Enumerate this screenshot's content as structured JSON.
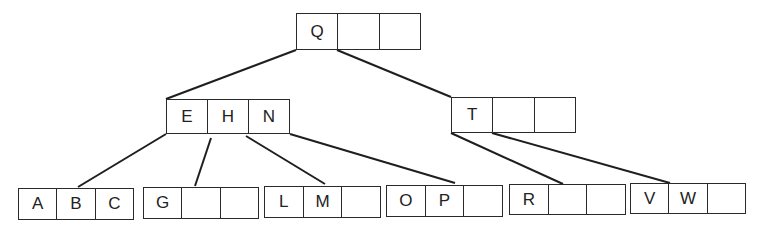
{
  "diagram": {
    "type": "b-tree",
    "nodes": [
      {
        "id": "root",
        "keys": [
          "Q",
          "",
          ""
        ],
        "x": 296,
        "y": 13,
        "w": 125,
        "h": 37
      },
      {
        "id": "ehn",
        "keys": [
          "E",
          "H",
          "N"
        ],
        "x": 166,
        "y": 99,
        "w": 124,
        "h": 35
      },
      {
        "id": "t",
        "keys": [
          "T",
          "",
          ""
        ],
        "x": 451,
        "y": 97,
        "w": 125,
        "h": 36
      },
      {
        "id": "abc",
        "keys": [
          "A",
          "B",
          "C"
        ],
        "x": 18,
        "y": 188,
        "w": 116,
        "h": 32
      },
      {
        "id": "g",
        "keys": [
          "G",
          "",
          ""
        ],
        "x": 143,
        "y": 187,
        "w": 116,
        "h": 32
      },
      {
        "id": "lm",
        "keys": [
          "L",
          "M",
          ""
        ],
        "x": 264,
        "y": 186,
        "w": 117,
        "h": 32
      },
      {
        "id": "op",
        "keys": [
          "O",
          "P",
          ""
        ],
        "x": 386,
        "y": 185,
        "w": 117,
        "h": 32
      },
      {
        "id": "r",
        "keys": [
          "R",
          "",
          ""
        ],
        "x": 509,
        "y": 184,
        "w": 117,
        "h": 31
      },
      {
        "id": "vw",
        "keys": [
          "V",
          "W",
          ""
        ],
        "x": 630,
        "y": 183,
        "w": 116,
        "h": 31
      }
    ],
    "edges": [
      {
        "from": "root",
        "to": "ehn",
        "x1": 296,
        "y1": 50,
        "x2": 166,
        "y2": 99
      },
      {
        "from": "root",
        "to": "t",
        "x1": 337,
        "y1": 50,
        "x2": 451,
        "y2": 97
      },
      {
        "from": "ehn",
        "to": "abc",
        "x1": 166,
        "y1": 134,
        "x2": 78,
        "y2": 187
      },
      {
        "from": "ehn",
        "to": "g",
        "x1": 211,
        "y1": 138,
        "x2": 195,
        "y2": 186
      },
      {
        "from": "ehn",
        "to": "lm",
        "x1": 246,
        "y1": 136,
        "x2": 325,
        "y2": 184
      },
      {
        "from": "ehn",
        "to": "op",
        "x1": 290,
        "y1": 134,
        "x2": 455,
        "y2": 183
      },
      {
        "from": "t",
        "to": "r",
        "x1": 451,
        "y1": 133,
        "x2": 563,
        "y2": 184
      },
      {
        "from": "t",
        "to": "vw",
        "x1": 492,
        "y1": 133,
        "x2": 670,
        "y2": 183
      }
    ]
  }
}
